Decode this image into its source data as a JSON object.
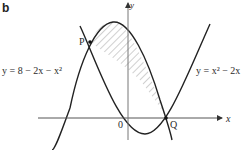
{
  "figure": {
    "part_label": "b",
    "axes": {
      "x_label": "x",
      "y_label": "y",
      "origin_label": "0"
    },
    "points": [
      {
        "name": "P"
      },
      {
        "name": "Q"
      }
    ],
    "curves": [
      {
        "id": "curve-1",
        "equation": "y = 8 − 2x − x²",
        "shape": "downward parabola"
      },
      {
        "id": "curve-2",
        "equation": "y = x² − 2x",
        "shape": "upward parabola"
      }
    ],
    "shaded_region": "region enclosed between the two curves, from P to Q",
    "colors": {
      "stroke": "#222222",
      "axis": "#555555",
      "hatch": "#888888",
      "background": "#ffffff"
    }
  }
}
